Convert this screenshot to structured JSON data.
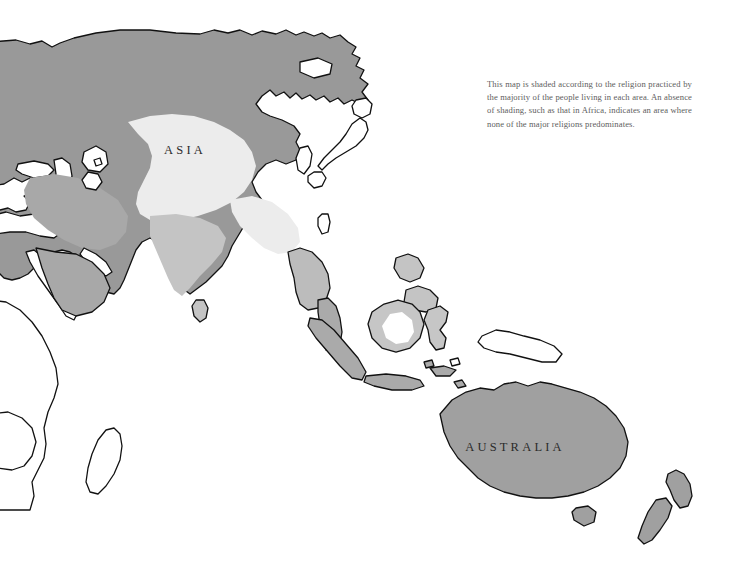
{
  "map": {
    "title": "World Religions Map",
    "labels": [
      {
        "name": "asia",
        "text": "ASIA",
        "x": 185,
        "y": 154
      },
      {
        "name": "australia",
        "text": "AUSTRALIA",
        "x": 515,
        "y": 451
      }
    ],
    "caption": "This map is shaded according to the religion practiced by the majority of the people living in each area. An absence of shading, such as that in Africa, indicates an area where none of the major religions predominates.",
    "colors": {
      "ocean": "#ffffff",
      "unshaded_land": "#ffffff",
      "shade_dark": "#999999",
      "shade_mid": "#a8a8a8",
      "shade_light": "#c4c4c4",
      "shade_very_light": "#ececec",
      "outline": "#111111",
      "label_text": "#2b2b2b",
      "caption_text": "#5d5d5d"
    },
    "shading_legend": [
      {
        "name": "northern-asia-band",
        "shade": "#999999",
        "description": "majority religion region covering northern and central Asia"
      },
      {
        "name": "china-band",
        "shade": "#ececec",
        "description": "very light shaded band across central-east Asia"
      },
      {
        "name": "india-band",
        "shade": "#c4c4c4",
        "description": "light shaded region over the Indian subcontinent"
      },
      {
        "name": "middle-east-band",
        "shade": "#a8a8a8",
        "description": "shaded region over the Middle East and Arabia"
      },
      {
        "name": "australia-region",
        "shade": "#a0a0a0",
        "description": "shaded region covering Australia and New Zealand"
      },
      {
        "name": "africa-region",
        "shade": "#ffffff",
        "description": "unshaded — no major religion predominates"
      }
    ]
  }
}
